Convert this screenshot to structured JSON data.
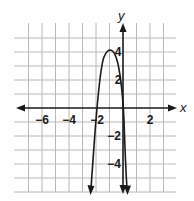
{
  "chart_data": {
    "type": "line",
    "title": "",
    "xlabel": "x",
    "ylabel": "y",
    "xlim": [
      -7,
      4
    ],
    "ylim": [
      -6,
      6
    ],
    "grid": true,
    "x_tick_labels": [
      "−6",
      "−4",
      "−2",
      "2"
    ],
    "x_tick_values": [
      -6,
      -4,
      -2,
      2
    ],
    "y_tick_labels": [
      "4",
      "2",
      "−2",
      "−4"
    ],
    "y_tick_values": [
      4,
      2,
      -2,
      -4
    ],
    "series": [
      {
        "name": "parabola",
        "equation": "y = -4(x + 1)^2 + 4",
        "vertex": [
          -1,
          4
        ],
        "x_intercepts": [
          -2,
          0
        ],
        "x": [
          -2.4,
          -2,
          -1.5,
          -1,
          -0.5,
          0,
          0.3
        ],
        "y": [
          -6,
          0,
          3,
          4,
          3,
          0,
          -6
        ],
        "arrows_both_ends": true
      }
    ]
  }
}
